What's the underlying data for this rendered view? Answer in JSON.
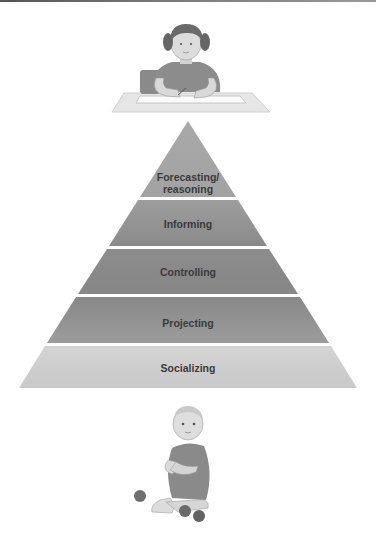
{
  "diagram": {
    "type": "pyramid",
    "top_illustration": "child-writing-at-desk",
    "bottom_illustration": "baby-sitting-with-balls",
    "levels_top_to_bottom": [
      {
        "label": "Forecasting/",
        "label2": "reasoning",
        "color": "#a7a7a7"
      },
      {
        "label": "Informing",
        "color": "#8f8f8f"
      },
      {
        "label": "Controlling",
        "color": "#8a8a8a"
      },
      {
        "label": "Projecting",
        "color": "#959595"
      },
      {
        "label": "Socializing",
        "color": "#cfcfcf"
      }
    ]
  }
}
